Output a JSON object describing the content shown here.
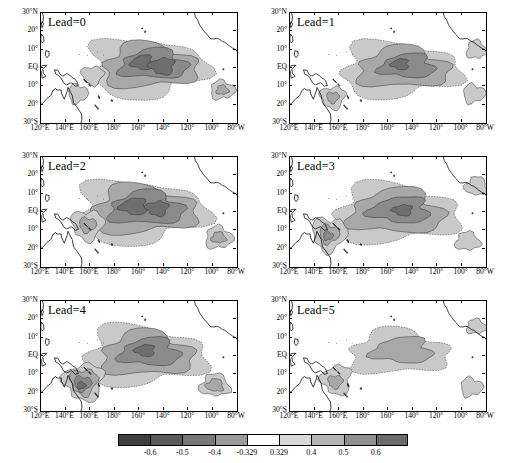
{
  "figure": {
    "title": "",
    "panel_count": 6,
    "background": "#ffffff"
  },
  "axes": {
    "y_ticks": [
      "30°N",
      "20°",
      "10°",
      "EQ",
      "10°",
      "20°",
      "30°S"
    ],
    "y_values": [
      30,
      20,
      10,
      0,
      -10,
      -20,
      -30
    ],
    "x_ticks": [
      "120°E",
      "140°E",
      "160°E",
      "180°",
      "160°",
      "140°",
      "120°",
      "100°",
      "80°W"
    ],
    "x_values": [
      120,
      140,
      160,
      180,
      200,
      220,
      240,
      260,
      280
    ],
    "xlim": [
      120,
      280
    ],
    "ylim": [
      -30,
      30
    ]
  },
  "panels": [
    {
      "label": "Lead=0",
      "row": 0,
      "col": 0
    },
    {
      "label": "Lead=1",
      "row": 0,
      "col": 1
    },
    {
      "label": "Lead=2",
      "row": 1,
      "col": 0
    },
    {
      "label": "Lead=3",
      "row": 1,
      "col": 1
    },
    {
      "label": "Lead=4",
      "row": 2,
      "col": 0
    },
    {
      "label": "Lead=5",
      "row": 2,
      "col": 1
    }
  ],
  "colorbar": {
    "orientation": "horizontal",
    "tick_labels": [
      "-0.6",
      "-0.5",
      "-0.4",
      "-0.329",
      "0.329",
      "0.4",
      "0.5",
      "0.6"
    ],
    "levels": [
      -0.7,
      -0.6,
      -0.5,
      -0.4,
      -0.329,
      0.329,
      0.4,
      0.5,
      0.6,
      0.7
    ],
    "colors": [
      "#3f3f3f",
      "#5a5a5a",
      "#777777",
      "#9a9a9a",
      "#ffffff",
      "#d8d8d8",
      "#b4b4b4",
      "#8f8f8f",
      "#6b6b6b"
    ]
  },
  "chart_data": {
    "type": "heatmap",
    "title": "",
    "subtitle": "",
    "xlabel": "",
    "ylabel": "",
    "xlim": [
      120,
      280
    ],
    "ylim": [
      -30,
      30
    ],
    "grid": false,
    "legend": "bottom colorbar",
    "panels": [
      {
        "name": "Lead=0",
        "categories": [
          "max_positive_shading"
        ],
        "values": [
          0.6
        ]
      },
      {
        "name": "Lead=1",
        "categories": [
          "max_positive_shading"
        ],
        "values": [
          0.5
        ]
      },
      {
        "name": "Lead=2",
        "categories": [
          "max_positive_shading"
        ],
        "values": [
          0.6
        ]
      },
      {
        "name": "Lead=3",
        "categories": [
          "max_positive_shading"
        ],
        "values": [
          0.5
        ]
      },
      {
        "name": "Lead=4",
        "categories": [
          "max_positive_shading"
        ],
        "values": [
          0.6
        ]
      },
      {
        "name": "Lead=5",
        "categories": [
          "max_positive_shading"
        ],
        "values": [
          0.4
        ]
      }
    ],
    "colorbar_levels": [
      -0.6,
      -0.5,
      -0.4,
      -0.329,
      0.329,
      0.4,
      0.5,
      0.6
    ]
  }
}
